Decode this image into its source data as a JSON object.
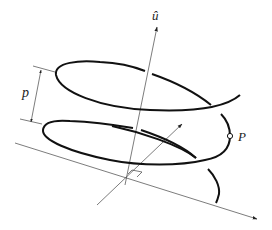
{
  "diagram": {
    "type": "helix-screw-axis",
    "labels": {
      "axis": "û",
      "pitch": "p",
      "point": "P"
    },
    "colors": {
      "stroke": "#111111",
      "thin": "#333333",
      "background": "#ffffff"
    },
    "elements": [
      "screw axis with unit vector û",
      "helix curve around axis",
      "pitch dimension p between successive turns",
      "point P on helix",
      "perpendicular reference line with arrow",
      "oblique arrow through axis",
      "right-angle marker at foot of axis"
    ]
  }
}
